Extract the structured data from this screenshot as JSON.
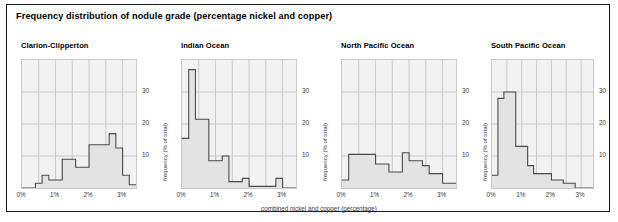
{
  "figure": {
    "title": "Frequency distribution of nodule grade (percentage nickel and copper)",
    "border_color": "#1a1a1a",
    "plot_bg": "#f2f2f2",
    "grid_color": "#c9c9c9",
    "step_color": "#4a4a4a",
    "fill_color": "#e3e3e3"
  },
  "axes": {
    "x_caption": "combined nickel and copper (percentage)",
    "y_caption": "frequency (% of total)",
    "x_ticks": [
      "0%",
      "1%",
      "2%",
      "3%"
    ],
    "x_tick_values": [
      0,
      1,
      2,
      3
    ],
    "y_ticks": [
      "10",
      "20",
      "30"
    ],
    "y_tick_values": [
      10,
      20,
      30
    ],
    "xlim": [
      0,
      3.4
    ],
    "ylim": [
      0,
      40
    ]
  },
  "panels": [
    {
      "title": "Clarion-Clipperton"
    },
    {
      "title": "Indian Ocean"
    },
    {
      "title": "North Pacific Ocean"
    },
    {
      "title": "South Pacific Ocean"
    }
  ],
  "chart_data": [
    {
      "type": "bar",
      "title": "Clarion-Clipperton",
      "xlabel": "combined nickel and copper (percentage)",
      "ylabel": "frequency (% of total)",
      "xlim": [
        0,
        3.4
      ],
      "ylim": [
        0,
        40
      ],
      "grid": true,
      "bin_width": 0.2,
      "bin_starts": [
        0.0,
        0.2,
        0.4,
        0.6,
        0.8,
        1.0,
        1.2,
        1.4,
        1.6,
        1.8,
        2.0,
        2.2,
        2.4,
        2.6,
        2.8,
        3.0,
        3.2
      ],
      "categories": [
        "0.0-0.2",
        "0.2-0.4",
        "0.4-0.6",
        "0.6-0.8",
        "0.8-1.0",
        "1.0-1.2",
        "1.2-1.4",
        "1.4-1.6",
        "1.6-1.8",
        "1.8-2.0",
        "2.0-2.2",
        "2.2-2.4",
        "2.4-2.6",
        "2.6-2.8",
        "2.8-3.0",
        "3.0-3.2",
        "3.2-3.4"
      ],
      "values": [
        0,
        0,
        1.5,
        4,
        2.5,
        2.5,
        9,
        9,
        6.5,
        6.5,
        13.5,
        13.5,
        13.5,
        17,
        12.5,
        4,
        1
      ]
    },
    {
      "type": "bar",
      "title": "Indian Ocean",
      "xlabel": "combined nickel and copper (percentage)",
      "ylabel": "frequency (% of total)",
      "xlim": [
        0,
        3.4
      ],
      "ylim": [
        0,
        40
      ],
      "grid": true,
      "bin_width": 0.2,
      "bin_starts": [
        0.0,
        0.2,
        0.4,
        0.6,
        0.8,
        1.0,
        1.2,
        1.4,
        1.6,
        1.8,
        2.0,
        2.2,
        2.4,
        2.6,
        2.8,
        3.0,
        3.2
      ],
      "categories": [
        "0.0-0.2",
        "0.2-0.4",
        "0.4-0.6",
        "0.6-0.8",
        "0.8-1.0",
        "1.0-1.2",
        "1.2-1.4",
        "1.4-1.6",
        "1.6-1.8",
        "1.8-2.0",
        "2.0-2.2",
        "2.2-2.4",
        "2.4-2.6",
        "2.6-2.8",
        "2.8-3.0",
        "3.0-3.2",
        "3.2-3.4"
      ],
      "values": [
        15.5,
        37,
        21.5,
        21.5,
        8.5,
        8.5,
        10,
        2,
        2,
        3,
        0.5,
        0.5,
        0.5,
        0.5,
        3,
        0,
        0
      ]
    },
    {
      "type": "bar",
      "title": "North Pacific Ocean",
      "xlabel": "combined nickel and copper (percentage)",
      "ylabel": "frequency (% of total)",
      "xlim": [
        0,
        3.4
      ],
      "ylim": [
        0,
        40
      ],
      "grid": true,
      "bin_width": 0.2,
      "bin_starts": [
        0.0,
        0.2,
        0.4,
        0.6,
        0.8,
        1.0,
        1.2,
        1.4,
        1.6,
        1.8,
        2.0,
        2.2,
        2.4,
        2.6,
        2.8,
        3.0,
        3.2
      ],
      "categories": [
        "0.0-0.2",
        "0.2-0.4",
        "0.4-0.6",
        "0.6-0.8",
        "0.8-1.0",
        "1.0-1.2",
        "1.2-1.4",
        "1.4-1.6",
        "1.6-1.8",
        "1.8-2.0",
        "2.0-2.2",
        "2.2-2.4",
        "2.4-2.6",
        "2.6-2.8",
        "2.8-3.0",
        "3.0-3.2",
        "3.2-3.4"
      ],
      "values": [
        2.5,
        10.5,
        10.5,
        10.5,
        10.5,
        7.5,
        7.5,
        5,
        5,
        11,
        8.5,
        8.5,
        7,
        4.5,
        4.5,
        1.5,
        1.5
      ]
    },
    {
      "type": "bar",
      "title": "South Pacific Ocean",
      "xlabel": "combined nickel and copper (percentage)",
      "ylabel": "frequency (% of total)",
      "xlim": [
        0,
        3.4
      ],
      "ylim": [
        0,
        40
      ],
      "grid": true,
      "bin_width": 0.2,
      "bin_starts": [
        0.0,
        0.2,
        0.4,
        0.6,
        0.8,
        1.0,
        1.2,
        1.4,
        1.6,
        1.8,
        2.0,
        2.2,
        2.4,
        2.6,
        2.8,
        3.0,
        3.2
      ],
      "categories": [
        "0.0-0.2",
        "0.2-0.4",
        "0.4-0.6",
        "0.6-0.8",
        "0.8-1.0",
        "1.0-1.2",
        "1.2-1.4",
        "1.4-1.6",
        "1.6-1.8",
        "1.8-2.0",
        "2.0-2.2",
        "2.2-2.4",
        "2.4-2.6",
        "2.6-2.8",
        "2.8-3.0",
        "3.0-3.2",
        "3.2-3.4"
      ],
      "values": [
        4,
        28,
        30,
        30,
        13,
        13,
        7,
        4.5,
        4.5,
        4.5,
        2.5,
        2.5,
        1.5,
        1.5,
        0,
        0,
        0
      ]
    }
  ]
}
